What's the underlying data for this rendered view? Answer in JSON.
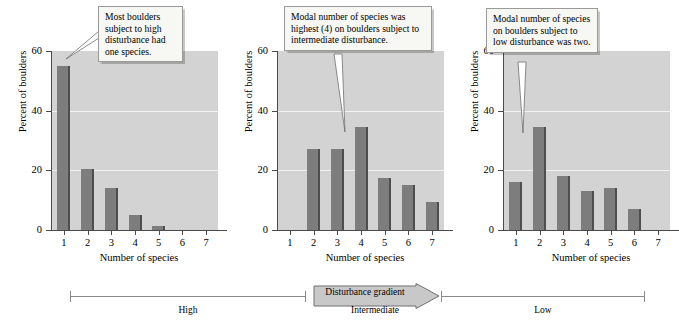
{
  "figure": {
    "shared": {
      "ylabel": "Percent of boulders",
      "xlabel": "Number of species",
      "yticks": [
        "0",
        "20",
        "40",
        "60"
      ],
      "xticks": [
        "1",
        "2",
        "3",
        "4",
        "5",
        "6",
        "7"
      ],
      "plot_bg_color": "#d3d3d3",
      "bar_color": "#7d7d7d",
      "bar_edge_color": "#4e4e4e",
      "gridline_color": "#f2f2f2"
    },
    "panels": [
      {
        "callout": "Most boulders subject to high disturbance had one species.",
        "callout_target_category": "1"
      },
      {
        "callout": "Modal number of species was highest (4) on boulders subject to intermediate disturbance.",
        "callout_target_category": "4"
      },
      {
        "callout": "Modal number of species on boulders subject to low disturbance was two.",
        "callout_target_category": "2"
      }
    ],
    "gradient": {
      "arrow_label": "Disturbance gradient",
      "left_label": "High",
      "middle_label": "Intermediate",
      "right_label": "Low"
    }
  },
  "chart_data": [
    {
      "type": "bar",
      "title": "",
      "xlabel": "Number of species",
      "ylabel": "Percent of boulders",
      "categories": [
        "1",
        "2",
        "3",
        "4",
        "5",
        "6",
        "7"
      ],
      "values": [
        55,
        20.5,
        14,
        5,
        1.5,
        0,
        0
      ],
      "ylim": [
        0,
        60
      ],
      "yticks": [
        0,
        20,
        40,
        60
      ],
      "grid": true,
      "legend": "none",
      "annotation": "Most boulders subject to high disturbance had one species.",
      "group": "High disturbance"
    },
    {
      "type": "bar",
      "title": "",
      "xlabel": "Number of species",
      "ylabel": "Percent of boulders",
      "categories": [
        "1",
        "2",
        "3",
        "4",
        "5",
        "6",
        "7"
      ],
      "values": [
        0,
        27,
        27,
        34.5,
        17.5,
        15,
        9.5
      ],
      "ylim": [
        0,
        60
      ],
      "yticks": [
        0,
        20,
        40,
        60
      ],
      "grid": true,
      "legend": "none",
      "annotation": "Modal number of species was highest (4) on boulders subject to intermediate disturbance.",
      "group": "Intermediate disturbance"
    },
    {
      "type": "bar",
      "title": "",
      "xlabel": "Number of species",
      "ylabel": "Percent of boulders",
      "categories": [
        "1",
        "2",
        "3",
        "4",
        "5",
        "6",
        "7"
      ],
      "values": [
        16,
        34.5,
        18,
        13,
        14,
        7,
        0
      ],
      "ylim": [
        0,
        60
      ],
      "yticks": [
        0,
        20,
        40,
        60
      ],
      "grid": true,
      "legend": "none",
      "annotation": "Modal number of species on boulders subject to low disturbance was two.",
      "group": "Low disturbance"
    }
  ]
}
